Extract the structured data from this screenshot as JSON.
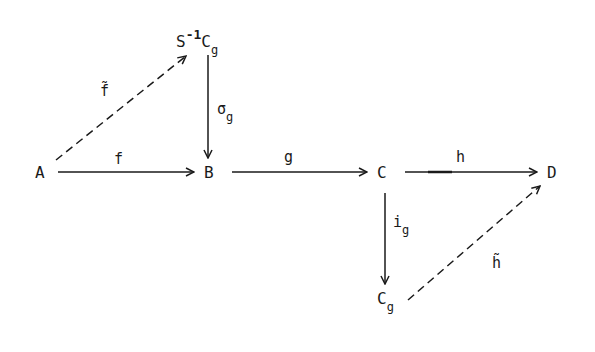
{
  "diagram": {
    "type": "commutative-diagram",
    "nodes": {
      "A": {
        "label": "A"
      },
      "B": {
        "label": "B"
      },
      "C": {
        "label": "C"
      },
      "D": {
        "label": "D"
      },
      "SinvCg": {
        "base": "S",
        "sup": "-1",
        "main": "C",
        "sub": "g"
      },
      "Cg": {
        "main": "C",
        "sub": "g"
      }
    },
    "arrows": {
      "f": {
        "label": "f",
        "from": "A",
        "to": "B",
        "style": "solid"
      },
      "g": {
        "label": "g",
        "from": "B",
        "to": "C",
        "style": "solid"
      },
      "h": {
        "label": "h",
        "from": "C",
        "to": "D",
        "style": "solid"
      },
      "sigma_g": {
        "main": "σ",
        "sub": "g",
        "from": "SinvCg",
        "to": "B",
        "style": "solid"
      },
      "i_g": {
        "main": "i",
        "sub": "g",
        "from": "C",
        "to": "Cg",
        "style": "solid"
      },
      "f_tilde": {
        "label": "f̃",
        "from": "A",
        "to": "SinvCg",
        "style": "dashed"
      },
      "h_tilde": {
        "label": "h̃",
        "from": "Cg",
        "to": "D",
        "style": "dashed"
      }
    },
    "colors": {
      "ink": "#1a1a1a",
      "background": "#ffffff"
    }
  }
}
